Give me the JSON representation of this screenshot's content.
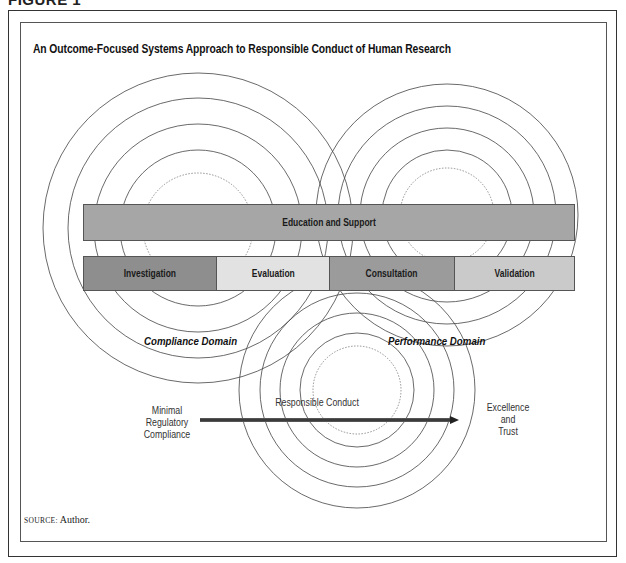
{
  "figure": {
    "label": "FIGURE 1",
    "title": "An Outcome-Focused Systems Approach to Responsible Conduct of Human Research",
    "source_prefix": "SOURCE:",
    "source_text": "Author."
  },
  "domains": {
    "compliance": "Compliance Domain",
    "performance": "Performance Domain"
  },
  "bars": {
    "top": {
      "label": "Education and Support",
      "color": "#a6a6a6"
    },
    "segments": [
      {
        "label": "Investigation",
        "color": "#8e8e8e"
      },
      {
        "label": "Evaluation",
        "color": "#e2e2e2"
      },
      {
        "label": "Consultation",
        "color": "#9b9b9b"
      },
      {
        "label": "Validation",
        "color": "#cacaca"
      }
    ]
  },
  "continuum": {
    "start_line1": "Minimal",
    "start_line2": "Regulatory",
    "start_line3": "Compliance",
    "center": "Responsible Conduct",
    "end_line1": "Excellence",
    "end_line2": "and",
    "end_line3": "Trust"
  },
  "circle_groups": [
    {
      "name": "compliance",
      "cx": 198,
      "cy": 228,
      "radii": [
        155,
        130,
        104,
        78
      ],
      "dotted_radius": 55
    },
    {
      "name": "performance",
      "cx": 447,
      "cy": 215,
      "radii": [
        131,
        109,
        87,
        65
      ],
      "dotted_radius": 47
    },
    {
      "name": "responsible-conduct",
      "cx": 357,
      "cy": 390,
      "radii": [
        118,
        97,
        77,
        57
      ],
      "dotted_radius": 44
    }
  ]
}
